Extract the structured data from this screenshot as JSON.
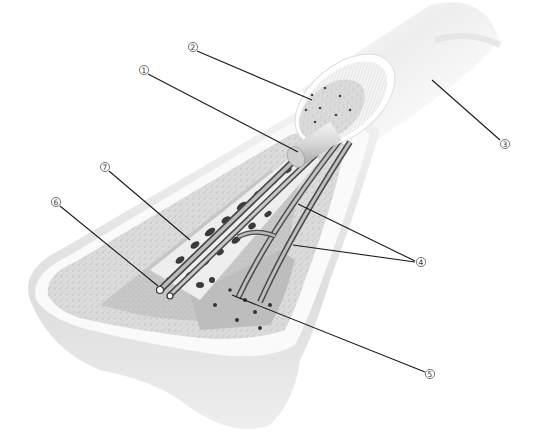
{
  "diagram": {
    "palette": {
      "background": "#ffffff",
      "periosteum": "#f3f3f3",
      "compact_bone": "#e9e9e9",
      "spongy_bone": "#d6d6d6",
      "cut_face": "#c4c4c4",
      "trabeculae": "#3a3a3a",
      "vessel": "#9a9a9a",
      "leader_line": "#1a1a1a"
    },
    "callouts": [
      {
        "id": "1",
        "label": "①",
        "x": 144,
        "y": 70,
        "target": "medullary cavity / marrow cylinder"
      },
      {
        "id": "2",
        "label": "②",
        "x": 193,
        "y": 47,
        "target": "compact bone ring (cut end)"
      },
      {
        "id": "3",
        "label": "③",
        "x": 505,
        "y": 144,
        "target": "periosteum / shaft outer surface"
      },
      {
        "id": "4",
        "label": "④",
        "x": 421,
        "y": 262,
        "target": "blood vessels / nerves"
      },
      {
        "id": "5",
        "label": "⑤",
        "x": 430,
        "y": 374,
        "target": "spongy bone (trabeculae)"
      },
      {
        "id": "6",
        "label": "⑥",
        "x": 56,
        "y": 202,
        "target": "vessel canal"
      },
      {
        "id": "7",
        "label": "⑦",
        "x": 105,
        "y": 167,
        "target": "vessel within spongy bone"
      }
    ]
  }
}
